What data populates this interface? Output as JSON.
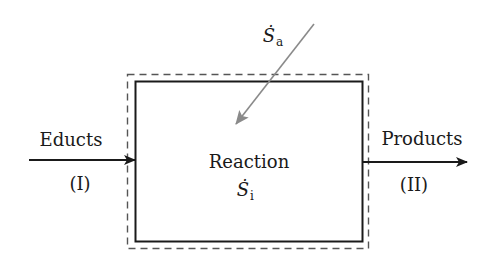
{
  "diagram": {
    "type": "control-volume-entropy-balance",
    "system": {
      "label": "Reaction",
      "internal_symbol": "Ṡ",
      "internal_subscript": "i"
    },
    "inflow": {
      "label": "Educts",
      "index": "(I)"
    },
    "outflow": {
      "label": "Products",
      "index": "(II)"
    },
    "external": {
      "symbol": "Ṡ",
      "subscript": "a"
    },
    "colors": {
      "stroke": "#1a1a1a",
      "external_arrow": "#8a8a8a",
      "boundary_dashed": "#555555"
    }
  }
}
